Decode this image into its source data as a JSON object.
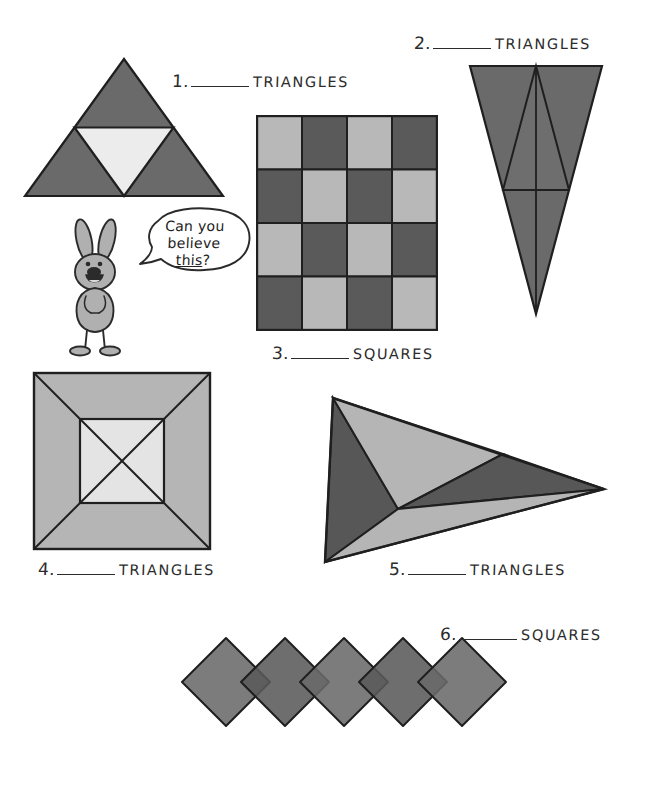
{
  "page": {
    "width": 645,
    "height": 789,
    "background": "#ffffff"
  },
  "character": {
    "name": "rabbit-mascot",
    "speech_line_1": "Can you",
    "speech_line_2": "believe",
    "speech_line_3_underlined": "this",
    "speech_line_3_tail": "?"
  },
  "palette": {
    "dark_gray": "#6a6a6a",
    "darker_gray": "#5a5a5a",
    "mid_gray": "#8c8c8c",
    "light_gray": "#b8b8b8",
    "pale_gray": "#d9d9d9",
    "near_white": "#ececec",
    "ink": "#2b2b2b",
    "rabbit_fill": "#b0b0b0"
  },
  "problems": [
    {
      "id": "1",
      "number": "1.",
      "shape_word": "TRIANGLES",
      "figure": "sierpinski-triangle",
      "description": "Large upward triangle with a light inverted triangle inscribed, creating four sub-triangles"
    },
    {
      "id": "2",
      "number": "2.",
      "shape_word": "TRIANGLES",
      "figure": "narrow-inverted-triangle",
      "description": "Tall narrow downward-pointing triangle with an inscribed inverted inner triangle and a vertical midline"
    },
    {
      "id": "3",
      "number": "3.",
      "shape_word": "SQUARES",
      "figure": "checkerboard-4x4",
      "description": "Four by four checkerboard of alternating light and dark squares",
      "grid": {
        "rows": 4,
        "cols": 4,
        "pattern": [
          [
            "light",
            "dark",
            "light",
            "dark"
          ],
          [
            "dark",
            "light",
            "dark",
            "light"
          ],
          [
            "light",
            "dark",
            "light",
            "dark"
          ],
          [
            "dark",
            "light",
            "dark",
            "light"
          ]
        ]
      }
    },
    {
      "id": "4",
      "number": "4.",
      "shape_word": "TRIANGLES",
      "figure": "nested-square-with-diagonals",
      "description": "Outer square joined by diagonals to a smaller inner square which itself is crossed by an X"
    },
    {
      "id": "5",
      "number": "5.",
      "shape_word": "TRIANGLES",
      "figure": "dart-triangle-subdivided",
      "description": "Wide triangle pointing right, subdivided into four sub-triangles from an interior vertex"
    },
    {
      "id": "6",
      "number": "6.",
      "shape_word": "SQUARES",
      "figure": "overlapping-diamond-chain",
      "description": "Chain of five rotated squares (diamonds) that overlap edge to edge"
    }
  ]
}
